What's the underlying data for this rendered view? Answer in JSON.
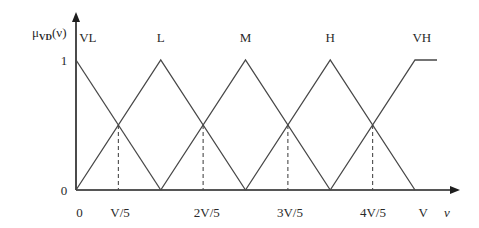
{
  "chart_data": {
    "type": "line",
    "title": "",
    "ylabel": {
      "base": "μ",
      "subscript": "VD",
      "suffix": "(ν)"
    },
    "xlabel": "ν",
    "x_unit": "V",
    "xlim": [
      0,
      1.13
    ],
    "ylim": [
      0,
      1
    ],
    "grid": false,
    "legend": "series names above peaks",
    "series": [
      {
        "name": "VL",
        "points": [
          [
            0,
            1
          ],
          [
            0.25,
            0
          ]
        ]
      },
      {
        "name": "L",
        "points": [
          [
            0,
            0
          ],
          [
            0.25,
            1
          ],
          [
            0.5,
            0
          ]
        ]
      },
      {
        "name": "M",
        "points": [
          [
            0.25,
            0
          ],
          [
            0.5,
            1
          ],
          [
            0.75,
            0
          ]
        ]
      },
      {
        "name": "H",
        "points": [
          [
            0.5,
            0
          ],
          [
            0.75,
            1
          ],
          [
            1,
            0
          ]
        ]
      },
      {
        "name": "VH",
        "points": [
          [
            0.75,
            0
          ],
          [
            1,
            1
          ],
          [
            1.065,
            1
          ]
        ]
      }
    ],
    "series_label_x": [
      0.035,
      0.25,
      0.5,
      0.75,
      1.02
    ],
    "crossovers": [
      {
        "x": 0.125,
        "y": 0.5
      },
      {
        "x": 0.375,
        "y": 0.5
      },
      {
        "x": 0.625,
        "y": 0.5
      },
      {
        "x": 0.875,
        "y": 0.5
      }
    ],
    "x_ticks": [
      {
        "label": "0",
        "x": 0.01
      },
      {
        "label": "V/5",
        "x": 0.13
      },
      {
        "label": "2V/5",
        "x": 0.386
      },
      {
        "label": "3V/5",
        "x": 0.631
      },
      {
        "label": "4V/5",
        "x": 0.876
      },
      {
        "label": "V",
        "x": 1.024
      }
    ],
    "y_ticks": [
      {
        "label": "1",
        "y": 1
      },
      {
        "label": "0",
        "y": 0
      }
    ]
  }
}
